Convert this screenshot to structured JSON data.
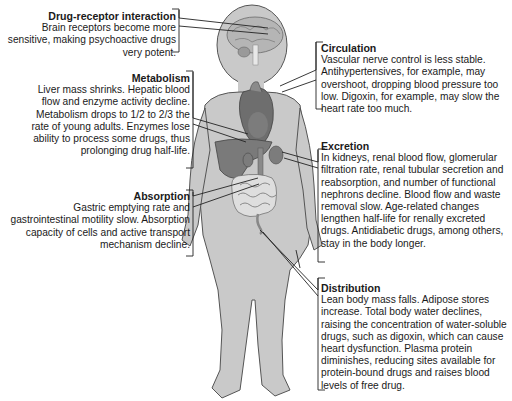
{
  "callouts": {
    "drug_receptor": {
      "title": "Drug-receptor interaction",
      "body": "Brain receptors become more sensitive, making psychoactive drugs very potent."
    },
    "metabolism": {
      "title": "Metabolism",
      "body": "Liver mass shrinks. Hepatic blood flow and enzyme activity decline. Metabolism drops to 1/2 to 2/3 the rate of young adults. Enzymes lose ability to process some drugs, thus prolonging drug half-life."
    },
    "absorption": {
      "title": "Absorption",
      "body": "Gastric emptying rate and gastrointestinal motility slow. Absorption capacity of cells and active transport mechanism decline."
    },
    "circulation": {
      "title": "Circulation",
      "body": "Vascular nerve control is less stable. Antihypertensives, for example, may overshoot, dropping blood pressure too low. Digoxin, for example, may slow the heart rate too much."
    },
    "excretion": {
      "title": "Excretion",
      "body": "In kidneys, renal blood flow, glomerular filtration rate, renal tubular secretion and reabsorption, and number of functional nephrons decline. Blood flow and waste removal slow. Age-related changes lengthen half-life for renally excreted drugs. Antidiabetic drugs, among others, stay in the body longer."
    },
    "distribution": {
      "title": "Distribution",
      "body": "Lean body mass falls. Adipose stores increase. Total body water declines, raising the concentration of water-soluble drugs, such as digoxin, which can cause heart dysfunction. Plasma protein diminishes, reducing sites available for protein-bound drugs and raises blood levels of free drug."
    }
  },
  "colors": {
    "body_fill": "#c9c9c9",
    "body_outline": "#555555",
    "organ_dark": "#6e6e6e",
    "organ_mid": "#8a8a8a",
    "intestine": "#dcdcdc",
    "text": "#1a1a1a"
  }
}
